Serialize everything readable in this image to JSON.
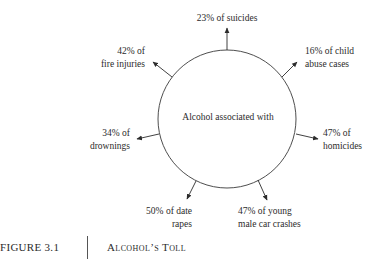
{
  "diagram": {
    "center_label": "Alcohol associated with",
    "items": [
      {
        "id": "suicides",
        "line1": "23% of suicides",
        "line2": ""
      },
      {
        "id": "child-abuse",
        "line1": "16% of child",
        "line2": "abuse cases"
      },
      {
        "id": "homicides",
        "line1": "47% of",
        "line2": "homicides"
      },
      {
        "id": "car-crashes",
        "line1": "47% of young",
        "line2": "male car crashes"
      },
      {
        "id": "date-rapes",
        "line1": "50% of date",
        "line2": "rapes"
      },
      {
        "id": "drownings",
        "line1": "34% of",
        "line2": "drownings"
      },
      {
        "id": "fire-injuries",
        "line1": "42% of",
        "line2": "fire injuries"
      }
    ]
  },
  "caption": {
    "figure_number": "FIGURE 3.1",
    "title": "Alcohol’s Toll"
  }
}
